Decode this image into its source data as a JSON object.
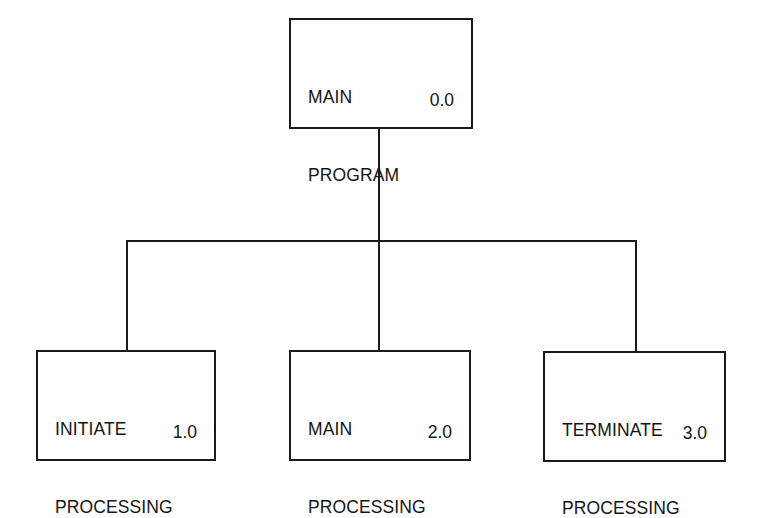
{
  "diagram": {
    "type": "hierarchy-chart",
    "root": {
      "id": "0.0",
      "label_lines": [
        "MAIN",
        "PROGRAM"
      ],
      "number": "0.0"
    },
    "children": [
      {
        "id": "1.0",
        "label_lines": [
          "INITIATE",
          "PROCESSING"
        ],
        "number": "1.0"
      },
      {
        "id": "2.0",
        "label_lines": [
          "MAIN",
          "PROCESSING"
        ],
        "number": "2.0"
      },
      {
        "id": "3.0",
        "label_lines": [
          "TERMINATE",
          "PROCESSING"
        ],
        "number": "3.0"
      }
    ],
    "edges": [
      {
        "from": "0.0",
        "to": "1.0"
      },
      {
        "from": "0.0",
        "to": "2.0"
      },
      {
        "from": "0.0",
        "to": "3.0"
      }
    ],
    "colors": {
      "stroke": "#1a1a1a",
      "text": "#141414",
      "background": "#ffffff"
    }
  }
}
